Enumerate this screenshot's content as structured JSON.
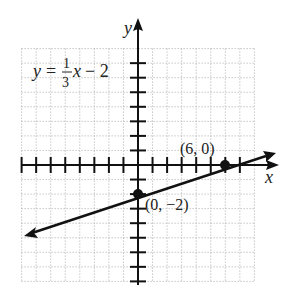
{
  "chart_data": {
    "type": "line",
    "title": "",
    "equation": {
      "lhs": "y",
      "equals": "=",
      "numerator": "1",
      "denominator": "3",
      "var": "x",
      "rest": "− 2"
    },
    "xlabel": "x",
    "ylabel": "y",
    "xlim": [
      -8,
      8
    ],
    "ylim": [
      -8,
      8
    ],
    "grid": true,
    "series": [
      {
        "name": "y = 1/3 x - 2",
        "slope": 0.3333,
        "intercept": -2,
        "x": [
          -8,
          0,
          6,
          7
        ],
        "y": [
          -4.67,
          -2,
          0,
          0.33
        ]
      }
    ],
    "points": [
      {
        "x": 0,
        "y": -2,
        "label": "(0, −2)"
      },
      {
        "x": 6,
        "y": 0,
        "label": "(6, 0)"
      }
    ],
    "colors": {
      "line": "#111111",
      "grid": "#aaaaaa",
      "axis": "#111111"
    }
  }
}
